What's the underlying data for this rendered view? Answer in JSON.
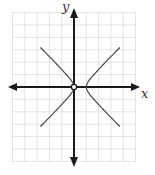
{
  "chart_data": {
    "type": "line",
    "title": "",
    "xlabel": "x",
    "ylabel": "y",
    "xlim": [
      -5,
      5
    ],
    "ylim": [
      -6,
      6
    ],
    "grid": true,
    "grid_step": 1,
    "axis_arrows": true,
    "series": [
      {
        "name": "hyperbola (x-0.5)^2/0.25 - y^2/0.25 = 1",
        "center": [
          0.5,
          0
        ],
        "vertices": [
          [
            0,
            0
          ],
          [
            1,
            0
          ]
        ],
        "asymptote_slopes": [
          1,
          -1
        ],
        "branches": [
          {
            "name": "left",
            "x": [
              -5,
              -4,
              -3,
              -2,
              -1,
              -0.5,
              0,
              -0.5,
              -1,
              -2,
              -3,
              -4,
              -5
            ],
            "y": [
              5.48,
              4.47,
              3.46,
              2.45,
              1.41,
              0.87,
              0,
              -0.87,
              -1.41,
              -2.45,
              -3.46,
              -4.47,
              -5.48
            ]
          },
          {
            "name": "right",
            "x": [
              5,
              4,
              3,
              2,
              1.5,
              1,
              1.5,
              2,
              3,
              4,
              5
            ],
            "y": [
              4.47,
              3.46,
              2.45,
              1.41,
              0.87,
              0,
              -0.87,
              -1.41,
              -2.45,
              -3.46,
              -4.47
            ]
          }
        ]
      }
    ],
    "annotations": [
      {
        "type": "open_circle",
        "at": [
          0,
          0
        ]
      }
    ]
  },
  "labels": {
    "x_axis": "x",
    "y_axis": "y"
  },
  "colors": {
    "axis": "#1a1a1a",
    "curve": "#444444",
    "grid": "#d8d8d8"
  }
}
